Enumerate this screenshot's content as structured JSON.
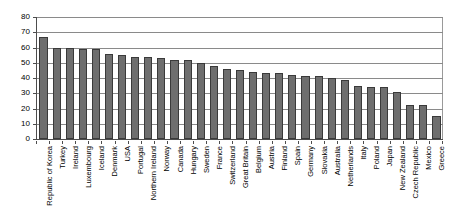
{
  "chart_data": {
    "type": "bar",
    "title": "",
    "subtitle": "",
    "xlabel": "",
    "ylabel": "",
    "ylim": [
      0,
      80
    ],
    "ytick_step": 10,
    "yticks": [
      0,
      10,
      20,
      30,
      40,
      50,
      60,
      70,
      80
    ],
    "grid": true,
    "legend": false,
    "legend_position": "none",
    "orientation": "vertical",
    "bar_color": "#6e6e6e",
    "bar_edge_color": "#3a3a3a",
    "categories": [
      "Republic of Korea",
      "Turkey",
      "Ireland",
      "Luxembourg",
      "Iceland",
      "Denmark",
      "USA",
      "Portugal",
      "Northern Ireland",
      "Norway",
      "Canada",
      "Hungary",
      "Sweden",
      "France",
      "Switzerland",
      "Great Britain",
      "Belgium",
      "Austria",
      "Finland",
      "Spain",
      "Germany",
      "Slovakia",
      "Australia",
      "Netherlands",
      "Italy",
      "Poland",
      "Japan",
      "New Zealand",
      "Czech Republic",
      "Mexico",
      "Greece"
    ],
    "values": [
      67,
      60,
      60,
      59,
      59,
      56,
      55,
      54,
      54,
      53,
      52,
      52,
      50,
      48,
      46,
      45,
      44,
      43,
      43,
      42,
      41,
      41,
      40,
      39,
      35,
      34,
      34,
      31,
      22,
      22,
      15
    ]
  },
  "axes": {
    "y_tick_labels": [
      "80",
      "70",
      "60",
      "50",
      "40",
      "30",
      "20",
      "10",
      "0"
    ]
  }
}
